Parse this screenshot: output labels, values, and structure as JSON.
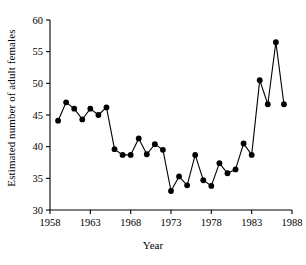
{
  "chart_data": {
    "type": "line",
    "title": "",
    "xlabel": "Year",
    "ylabel": "Estimated number of adult females",
    "xlim": [
      1958,
      1988
    ],
    "ylim": [
      30,
      60
    ],
    "xticks": [
      1958,
      1963,
      1968,
      1973,
      1978,
      1983,
      1988
    ],
    "yticks": [
      30,
      35,
      40,
      45,
      50,
      55,
      60
    ],
    "grid": false,
    "legend": null,
    "marker": "filled-circle",
    "line_color": "#000000",
    "marker_color": "#000000",
    "x": [
      1959,
      1960,
      1961,
      1962,
      1963,
      1964,
      1965,
      1966,
      1967,
      1968,
      1969,
      1970,
      1971,
      1972,
      1973,
      1974,
      1975,
      1976,
      1977,
      1978,
      1979,
      1980,
      1981,
      1982,
      1983,
      1984,
      1985,
      1986,
      1987
    ],
    "values": [
      44.1,
      47.0,
      46.0,
      44.3,
      46.0,
      45.0,
      46.2,
      39.6,
      38.7,
      38.7,
      41.3,
      38.8,
      40.4,
      39.5,
      33.0,
      35.3,
      33.9,
      38.7,
      34.7,
      33.8,
      37.4,
      35.8,
      36.4,
      40.5,
      38.7,
      50.5,
      46.7,
      56.5,
      46.7
    ],
    "series_name": "Estimated number of adult females"
  },
  "axis": {
    "x_tick_labels": [
      "1958",
      "1963",
      "1968",
      "1973",
      "1978",
      "1983",
      "1988"
    ],
    "y_tick_labels": [
      "30",
      "35",
      "40",
      "45",
      "50",
      "55",
      "60"
    ],
    "x_title": "Year",
    "y_title": "Estimated number of adult females"
  }
}
